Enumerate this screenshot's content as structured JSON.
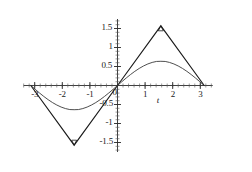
{
  "chart_data": {
    "type": "line",
    "title": "",
    "subtitle": "",
    "xlabel": "t",
    "ylabel": "",
    "xlim": [
      -3.4,
      3.45
    ],
    "ylim": [
      -1.75,
      1.75
    ],
    "grid": false,
    "legend": null,
    "legend_position": "none",
    "x_ticks": [
      -3,
      -2,
      -1,
      0,
      1,
      2,
      3
    ],
    "x_tick_labels": [
      "-3",
      "-2",
      "-1",
      "0",
      "1",
      "2",
      "3"
    ],
    "y_ticks": [
      -1.5,
      -1,
      -0.5,
      0.5,
      1,
      1.5
    ],
    "y_tick_labels": [
      "-1.5",
      "-1",
      "-0.5",
      "0.5",
      "1",
      "1.5"
    ],
    "x_minor_tick_step": 0.2,
    "y_minor_tick_step": 0.1,
    "annotations": [
      {
        "name": "peak-marker",
        "x": 1.5708,
        "y": 1.5708,
        "shape": "triangle-up"
      },
      {
        "name": "trough-marker",
        "x": -1.5708,
        "y": -1.5708,
        "shape": "triangle-down"
      }
    ],
    "series": [
      {
        "name": "triangular-wave",
        "type": "line",
        "color": "#1a1a1a",
        "width": 1.1,
        "x": [
          -3.1416,
          -1.5708,
          0,
          1.5708,
          3.1416
        ],
        "y": [
          0,
          -1.5708,
          0,
          1.5708,
          0
        ]
      },
      {
        "name": "smooth-sine-curve",
        "type": "line",
        "color": "#3a3a3a",
        "width": 0.9,
        "x": [
          -3.1416,
          -2.9845,
          -2.8274,
          -2.6704,
          -2.5133,
          -2.3562,
          -2.1991,
          -2.042,
          -1.885,
          -1.7279,
          -1.5708,
          -1.4137,
          -1.2566,
          -1.0996,
          -0.9425,
          -0.7854,
          -0.6283,
          -0.4712,
          -0.3142,
          -0.1571,
          0,
          0.1571,
          0.3142,
          0.4712,
          0.6283,
          0.7854,
          0.9425,
          1.0996,
          1.2566,
          1.4137,
          1.5708,
          1.7279,
          1.885,
          2.042,
          2.1991,
          2.3562,
          2.5133,
          2.6704,
          2.8274,
          2.9845,
          3.1416
        ],
        "y": [
          0,
          -0.0992,
          -0.1959,
          -0.2878,
          -0.3727,
          -0.4487,
          -0.514,
          -0.5672,
          -0.6071,
          -0.633,
          -0.6366,
          -0.633,
          -0.6071,
          -0.5672,
          -0.514,
          -0.4487,
          -0.3727,
          -0.2878,
          -0.1959,
          -0.0992,
          0,
          0.0992,
          0.1959,
          0.2878,
          0.3727,
          0.4487,
          0.514,
          0.5672,
          0.6071,
          0.633,
          0.6366,
          0.633,
          0.6071,
          0.5672,
          0.514,
          0.4487,
          0.3727,
          0.2878,
          0.1959,
          0.0992,
          0
        ]
      }
    ]
  },
  "axes": {
    "x_axis_name": "t",
    "origin_label": "0"
  }
}
